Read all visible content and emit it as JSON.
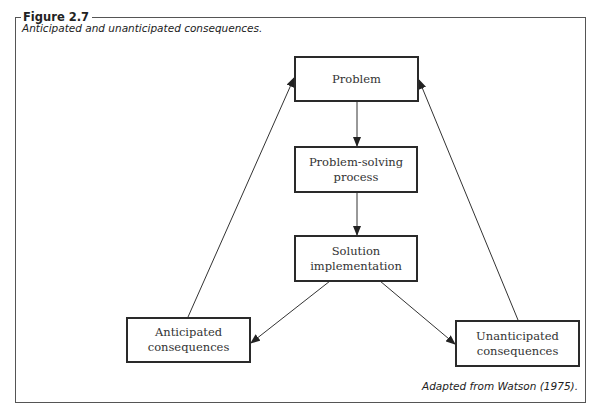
{
  "figure": {
    "label": "Figure 2.7",
    "caption": "Anticipated and unanticipated consequences.",
    "source": "Adapted from Watson (1975)."
  },
  "diagram": {
    "nodes": [
      {
        "id": "problem",
        "label": "Problem"
      },
      {
        "id": "process",
        "label": "Problem-solving process"
      },
      {
        "id": "solution",
        "label": "Solution implementation"
      },
      {
        "id": "anticipated",
        "label": "Anticipated consequences"
      },
      {
        "id": "unanticipated",
        "label": "Unanticipated consequences"
      }
    ],
    "edges": [
      {
        "from": "problem",
        "to": "process"
      },
      {
        "from": "process",
        "to": "solution"
      },
      {
        "from": "solution",
        "to": "anticipated"
      },
      {
        "from": "solution",
        "to": "unanticipated"
      },
      {
        "from": "anticipated",
        "to": "problem"
      },
      {
        "from": "unanticipated",
        "to": "problem"
      }
    ]
  }
}
